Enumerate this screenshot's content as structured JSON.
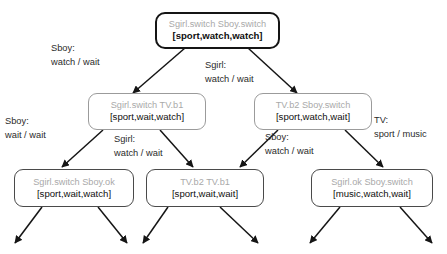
{
  "diagram": {
    "type": "transition-tree",
    "nodes": [
      {
        "id": "root",
        "state": "Sgirl.switch Sboy.switch",
        "values": "[sport,watch,watch]",
        "level": 0
      },
      {
        "id": "mid-left",
        "state": "Sgirl.switch TV.b1",
        "values": "[sport,wait,watch]",
        "level": 1
      },
      {
        "id": "mid-right",
        "state": "TV.b2 Sboy.switch",
        "values": "[sport,watch,wait]",
        "level": 1
      },
      {
        "id": "leaf-left",
        "state": "Sgirl.switch Sboy.ok",
        "values": "[sport,wait,watch]",
        "level": 2
      },
      {
        "id": "leaf-middle",
        "state": "TV.b2 TV.b1",
        "values": "[sport,wait,wait]",
        "level": 2
      },
      {
        "id": "leaf-right",
        "state": "Sgirl.ok Sboy.switch",
        "values": "[music,watch,wait]",
        "level": 2
      }
    ],
    "edge_labels": [
      {
        "id": "root-to-mid-left",
        "actor": "Sboy:",
        "transition": "watch / wait"
      },
      {
        "id": "root-to-mid-right",
        "actor": "Sgirl:",
        "transition": "watch / wait"
      },
      {
        "id": "mid-left-to-leaf-left",
        "actor": "Sboy:",
        "transition": "wait / wait"
      },
      {
        "id": "mid-left-to-leaf-middle",
        "actor": "Sgirl:",
        "transition": "watch / wait"
      },
      {
        "id": "mid-right-to-leaf-middle",
        "actor": "Sboy:",
        "transition": "watch / wait"
      },
      {
        "id": "mid-right-to-leaf-right",
        "actor": "TV:",
        "transition": "sport / music"
      }
    ]
  }
}
